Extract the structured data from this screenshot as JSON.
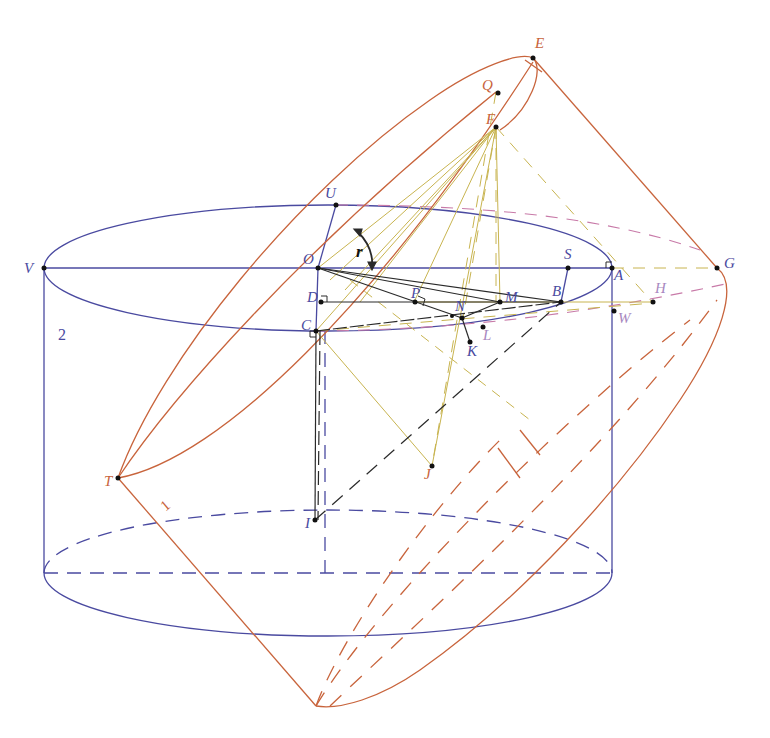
{
  "figure": {
    "type": "geometry-diagram"
  },
  "colors": {
    "cylinder": "#4a4aa0",
    "plane": "#c8643c",
    "construction": "#c8b450",
    "dark": "#2a2a2a",
    "pink_dashed": "#c87aa8"
  },
  "labels": {
    "O": "O",
    "U": "U",
    "V": "V",
    "A": "A",
    "S": "S",
    "G": "G",
    "H": "H",
    "W": "W",
    "B": "B",
    "M": "M",
    "N": "N",
    "P": "P",
    "D": "D",
    "C": "C",
    "K": "K",
    "L": "L",
    "E": "E",
    "Q": "Q",
    "F": "F",
    "T": "T",
    "J": "J",
    "I": "I",
    "r": "r"
  },
  "dimensions": {
    "height_label": "2",
    "segment_label": "1"
  }
}
